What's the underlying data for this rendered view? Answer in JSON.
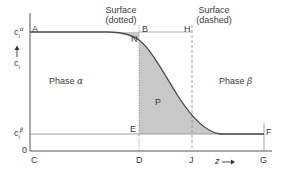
{
  "diagram": {
    "axes": {
      "y_label": "c",
      "y_label_sub": "i",
      "y_tick_top": "c",
      "y_tick_top_sub": "i",
      "y_tick_top_sup": "α",
      "y_tick_mid": "c",
      "y_tick_mid_sub": "i",
      "y_tick_mid_sup": "β",
      "y_zero": "0",
      "x_label": "z",
      "x_arrow": "⟶"
    },
    "surfaces": {
      "dotted": {
        "line1": "Surface",
        "line2": "(dotted)"
      },
      "dashed": {
        "line1": "Surface",
        "line2": "(dashed)"
      }
    },
    "phases": {
      "alpha": {
        "label": "Phase",
        "symbol": "α"
      },
      "beta": {
        "label": "Phase",
        "symbol": "β"
      }
    },
    "points": {
      "A": "A",
      "B": "B",
      "H": "H",
      "N": "N",
      "P": "P",
      "E": "E",
      "F": "F",
      "C": "C",
      "D": "D",
      "J": "J",
      "G": "G"
    },
    "colors": {
      "axis": "#555555",
      "curve": "#4a4a4a",
      "shade": "#c8c8c8",
      "guide": "#9a9a9a",
      "text": "#3a3a3a"
    }
  }
}
